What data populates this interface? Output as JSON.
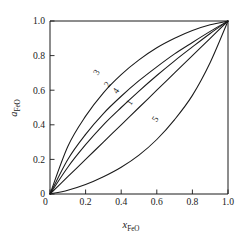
{
  "chart_data": {
    "type": "line",
    "title": "",
    "subtitle": "",
    "xlabel": "x_FeO",
    "ylabel": "a_FeO",
    "xlabel_base": "x",
    "xlabel_sub": "FeO",
    "ylabel_base": "a",
    "ylabel_sub": "FeO",
    "xlim": [
      0,
      1
    ],
    "ylim": [
      0,
      1
    ],
    "xticks": [
      0,
      0.2,
      0.4,
      0.6,
      0.8,
      1.0
    ],
    "yticks": [
      0,
      0.2,
      0.4,
      0.6,
      0.8,
      1.0
    ],
    "xtick_labels": [
      "0",
      "0.2",
      "0.4",
      "0.6",
      "0.8",
      "1.0"
    ],
    "ytick_labels": [
      "0",
      "0.2",
      "0.4",
      "0.6",
      "0.8",
      "1.0"
    ],
    "grid": false,
    "legend": "inline-curve-labels",
    "frame": "box",
    "line_color": "#1a1a1a",
    "background": "#ffffff",
    "series": [
      {
        "name": "1",
        "label": "1",
        "description": "ideal Raoultian line",
        "x": [
          0,
          0.1,
          0.2,
          0.3,
          0.4,
          0.5,
          0.6,
          0.7,
          0.8,
          0.9,
          1.0
        ],
        "values": [
          0,
          0.1,
          0.2,
          0.3,
          0.4,
          0.5,
          0.6,
          0.7,
          0.8,
          0.9,
          1.0
        ],
        "label_x": 0.46,
        "label_y": 0.52
      },
      {
        "name": "2",
        "label": "2",
        "description": "positive deviation, moderate",
        "x": [
          0,
          0.1,
          0.2,
          0.3,
          0.4,
          0.5,
          0.6,
          0.7,
          0.8,
          0.9,
          1.0
        ],
        "values": [
          0,
          0.2,
          0.345,
          0.465,
          0.565,
          0.655,
          0.735,
          0.81,
          0.876,
          0.94,
          1.0
        ],
        "label_x": 0.335,
        "label_y": 0.625
      },
      {
        "name": "3",
        "label": "3",
        "description": "positive deviation, strongest",
        "x": [
          0,
          0.1,
          0.2,
          0.3,
          0.4,
          0.5,
          0.6,
          0.7,
          0.8,
          0.9,
          1.0
        ],
        "values": [
          0,
          0.275,
          0.45,
          0.585,
          0.69,
          0.775,
          0.845,
          0.9,
          0.945,
          0.978,
          1.0
        ],
        "label_x": 0.275,
        "label_y": 0.695
      },
      {
        "name": "4",
        "label": "4",
        "description": "positive deviation, slight",
        "x": [
          0,
          0.1,
          0.2,
          0.3,
          0.4,
          0.5,
          0.6,
          0.7,
          0.8,
          0.9,
          1.0
        ],
        "values": [
          0,
          0.155,
          0.285,
          0.4,
          0.5,
          0.595,
          0.685,
          0.77,
          0.85,
          0.928,
          1.0
        ],
        "label_x": 0.385,
        "label_y": 0.588
      },
      {
        "name": "5",
        "label": "5",
        "description": "negative deviation",
        "x": [
          0,
          0.1,
          0.2,
          0.3,
          0.4,
          0.5,
          0.6,
          0.7,
          0.8,
          0.9,
          1.0
        ],
        "values": [
          0,
          0.022,
          0.055,
          0.1,
          0.155,
          0.225,
          0.315,
          0.43,
          0.57,
          0.76,
          1.0
        ],
        "label_x": 0.605,
        "label_y": 0.425
      }
    ]
  },
  "axes": {
    "x_title_base": "x",
    "x_title_sub": "FeO",
    "y_title_base": "a",
    "y_title_sub": "FeO"
  }
}
